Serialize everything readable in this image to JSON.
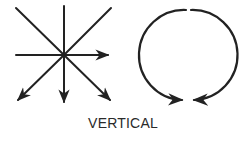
{
  "diagram": {
    "caption": "VERTICAL",
    "stroke_color": "#222222",
    "background": "#ffffff",
    "symbols": [
      {
        "name": "starburst-arrows",
        "description": "Eight lines radiating from a central point; arrows on right, bottom-left, bottom, bottom-right",
        "arrows": [
          "right",
          "down-left",
          "down",
          "down-right"
        ],
        "plain_lines": [
          "up",
          "up-left",
          "up-right",
          "left"
        ]
      },
      {
        "name": "circular-arrows",
        "description": "Circle split at top into two arcs, each ending in an arrowhead meeting at the bottom",
        "arrows": [
          "bottom-left-to-center",
          "bottom-right-to-center"
        ]
      }
    ]
  }
}
